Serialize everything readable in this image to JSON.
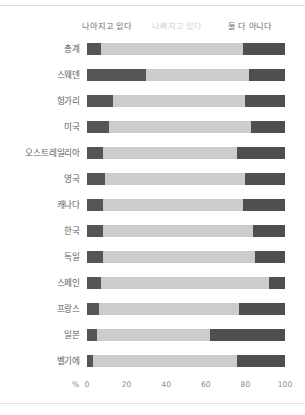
{
  "legend": {
    "better": "나아지고 있다",
    "worse": "나빠지고 있다",
    "neither": "둘 다 아니다"
  },
  "axis": {
    "unit": "%",
    "ticks": [
      "0",
      "20",
      "40",
      "60",
      "80",
      "100"
    ]
  },
  "colors": {
    "better": "#555555",
    "worse": "#cccccc",
    "neither": "#4f4f4f",
    "text": "#6b6b6b",
    "worse_label": "#d2d2d2"
  },
  "chart_data": {
    "type": "bar",
    "title": "",
    "xlabel": "%",
    "ylabel": "",
    "xlim": [
      0,
      100
    ],
    "grid": false,
    "stacked": true,
    "orientation": "horizontal",
    "legend_position": "top",
    "categories": [
      "총계",
      "스웨덴",
      "헝가리",
      "미국",
      "오스트레일리아",
      "영국",
      "캐나다",
      "한국",
      "독일",
      "스페인",
      "프랑스",
      "일본",
      "벨기에"
    ],
    "series": [
      {
        "name": "나아지고 있다",
        "color": "#555555",
        "values": [
          7,
          30,
          13,
          11,
          8,
          9,
          8,
          8,
          8,
          7,
          6,
          5,
          3
        ]
      },
      {
        "name": "나빠지고 있다",
        "color": "#cccccc",
        "values": [
          72,
          52,
          67,
          72,
          68,
          71,
          71,
          76,
          77,
          85,
          71,
          57,
          73
        ]
      },
      {
        "name": "둘 다 아니다",
        "color": "#4f4f4f",
        "values": [
          21,
          18,
          20,
          17,
          24,
          20,
          21,
          16,
          15,
          8,
          23,
          38,
          24
        ]
      }
    ]
  }
}
